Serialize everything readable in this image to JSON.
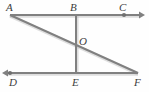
{
  "figure": {
    "kind": "geometry-line-diagram",
    "width": 149,
    "height": 92,
    "background_color": "#fefefe",
    "line_color": "#808080",
    "line_highlight_color": "#b9b9b9",
    "label_color": "#3d3d3d",
    "line_width": 2,
    "points": {
      "A": {
        "label": "A",
        "x": 10,
        "y": 15,
        "has_dot": false,
        "dot_color": "#6f6f6f"
      },
      "B": {
        "label": "B",
        "x": 76,
        "y": 15,
        "has_dot": false,
        "dot_color": "#6f6f6f"
      },
      "C": {
        "label": "C",
        "x": 124,
        "y": 15,
        "has_dot": true,
        "dot_color": "#6f6f6f"
      },
      "O": {
        "label": "O",
        "x": 76,
        "y": 45,
        "has_dot": false,
        "dot_color": "#6f6f6f"
      },
      "D": {
        "label": "D",
        "x": 10,
        "y": 73,
        "has_dot": true,
        "dot_color": "#6f6f6f"
      },
      "E": {
        "label": "E",
        "x": 76,
        "y": 73,
        "has_dot": false,
        "dot_color": "#6f6f6f"
      },
      "F": {
        "label": "F",
        "x": 138,
        "y": 73,
        "has_dot": false,
        "dot_color": "#6f6f6f"
      }
    },
    "segments": [
      {
        "name": "ray-ABC",
        "from": "A",
        "through": "B",
        "to": "C",
        "arrow_at_end": true,
        "arrow_tip_x": 145,
        "arrow_tip_y": 15
      },
      {
        "name": "ray-FED",
        "from": "F",
        "through": "E",
        "to": "D",
        "arrow_at_end": true,
        "arrow_tip_x": 2,
        "arrow_tip_y": 73
      },
      {
        "name": "segment-BE",
        "from": "B",
        "through": "O",
        "to": "E",
        "arrow_at_end": false,
        "arrow_tip_x": null,
        "arrow_tip_y": null
      },
      {
        "name": "segment-AF",
        "from": "A",
        "through": "O",
        "to": "F",
        "arrow_at_end": false,
        "arrow_tip_x": null,
        "arrow_tip_y": null
      }
    ]
  }
}
